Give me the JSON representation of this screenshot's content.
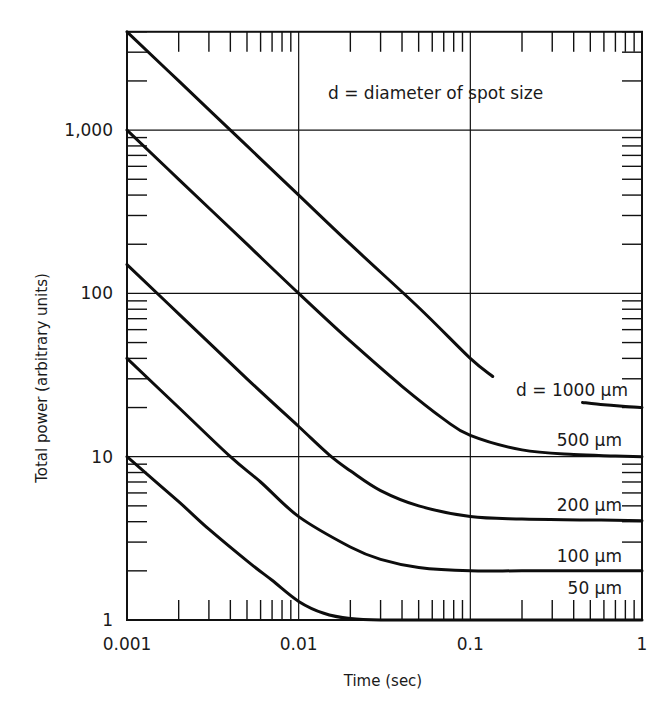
{
  "chart_data": {
    "type": "line",
    "title": "",
    "xlabel": "Time (sec)",
    "ylabel": "Total power (arbitrary units)",
    "xscale": "log",
    "yscale": "log",
    "xlim": [
      0.001,
      1
    ],
    "ylim": [
      1,
      4000
    ],
    "grid": true,
    "x_tick_labels": [
      {
        "value": 0.001,
        "label": "0.001"
      },
      {
        "value": 0.01,
        "label": "0.01"
      },
      {
        "value": 0.1,
        "label": "0.1"
      },
      {
        "value": 1,
        "label": "1"
      }
    ],
    "y_tick_labels": [
      {
        "value": 1,
        "label": "1"
      },
      {
        "value": 10,
        "label": "10"
      },
      {
        "value": 100,
        "label": "100"
      },
      {
        "value": 1000,
        "label": "1,000"
      }
    ],
    "annotation": "d = diameter of spot size",
    "series": [
      {
        "name": "d = 1000 μm",
        "label": "d = 1000 μm",
        "segments": [
          {
            "x": [
              0.001,
              0.002,
              0.005,
              0.01,
              0.02,
              0.05,
              0.1,
              0.135
            ],
            "y": [
              4000,
              2000,
              800,
              400,
              200,
              82,
              40,
              31
            ]
          },
          {
            "x": [
              0.45,
              0.6,
              0.8,
              1.0
            ],
            "y": [
              21.5,
              20.8,
              20.3,
              20
            ]
          }
        ]
      },
      {
        "name": "500 μm",
        "label": "500 μm",
        "segments": [
          {
            "x": [
              0.001,
              0.002,
              0.005,
              0.01,
              0.02,
              0.04,
              0.07,
              0.1,
              0.2,
              0.4,
              0.7,
              1.0
            ],
            "y": [
              1000,
              500,
              200,
              100,
              51,
              27,
              17,
              13.5,
              11,
              10.3,
              10.1,
              10
            ]
          }
        ]
      },
      {
        "name": "200 μm",
        "label": "200 μm",
        "segments": [
          {
            "x": [
              0.001,
              0.002,
              0.005,
              0.01,
              0.015,
              0.02,
              0.03,
              0.05,
              0.1,
              0.2,
              0.5,
              1.0
            ],
            "y": [
              150,
              75,
              30,
              15.3,
              10.3,
              8.2,
              6.2,
              5.0,
              4.3,
              4.15,
              4.1,
              4.05
            ]
          }
        ]
      },
      {
        "name": "100 μm",
        "label": "100 μm",
        "segments": [
          {
            "x": [
              0.001,
              0.002,
              0.004,
              0.006,
              0.01,
              0.02,
              0.03,
              0.05,
              0.1,
              0.2,
              0.5,
              1.0
            ],
            "y": [
              40,
              20,
              10,
              7,
              4.3,
              2.8,
              2.35,
              2.1,
              2.0,
              2.0,
              2.0,
              2.0
            ]
          }
        ]
      },
      {
        "name": "50 μm",
        "label": "50 μm",
        "segments": [
          {
            "x": [
              0.001,
              0.002,
              0.003,
              0.005,
              0.007,
              0.01,
              0.014,
              0.02,
              0.03,
              0.1,
              1.0
            ],
            "y": [
              10,
              5.3,
              3.6,
              2.3,
              1.75,
              1.3,
              1.1,
              1.02,
              1.0,
              1.0,
              1.0
            ]
          }
        ]
      }
    ]
  }
}
